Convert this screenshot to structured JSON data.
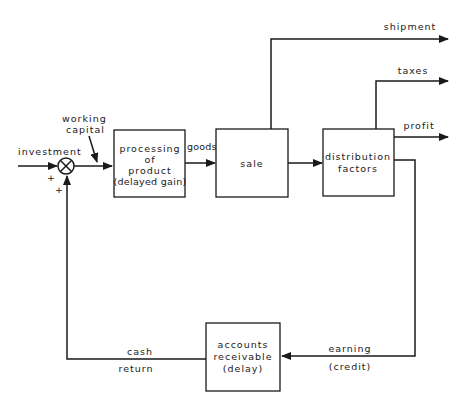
{
  "diagram": {
    "type": "block-diagram",
    "inputs": {
      "investment": "investment",
      "working_capital_line1": "working",
      "working_capital_line2": "capital",
      "plus_top": "+",
      "plus_bottom": "+"
    },
    "blocks": {
      "processing": {
        "line1": "processing",
        "line2": "of",
        "line3": "product",
        "line4": "(delayed gain)"
      },
      "sale": {
        "line1": "sale"
      },
      "distribution": {
        "line1": "distribution",
        "line2": "factors"
      },
      "accounts": {
        "line1": "accounts",
        "line2": "receivable",
        "line3": "(delay)"
      }
    },
    "flows": {
      "goods": "goods",
      "shipment": "shipment",
      "taxes": "taxes",
      "profit": "profit",
      "earning": "earning",
      "credit": "(credit)",
      "cash": "cash",
      "return": "return"
    },
    "colors": {
      "ink": "#1a1a1a",
      "background": "#ffffff"
    }
  }
}
